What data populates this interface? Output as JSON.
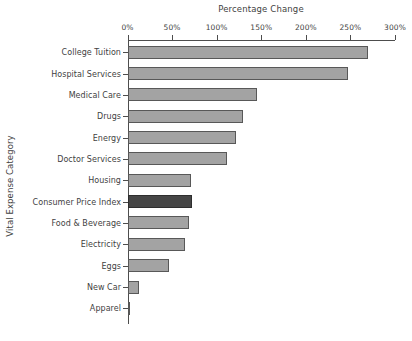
{
  "chart_data": {
    "type": "bar",
    "orientation": "horizontal",
    "title": "Percentage Change",
    "xlabel": "Percentage Change",
    "ylabel": "Vital Expense Category",
    "xlim": [
      0,
      300
    ],
    "xticks": [
      0,
      50,
      100,
      150,
      200,
      250,
      300
    ],
    "xticklabels": [
      "0%",
      "50%",
      "100%",
      "150%",
      "200%",
      "250%",
      "300%"
    ],
    "grid": false,
    "legend": "none",
    "axis_position": "top",
    "categories": [
      "College Tuition",
      "Hospital Services",
      "Medical Care",
      "Drugs",
      "Energy",
      "Doctor Services",
      "Housing",
      "Consumer Price Index",
      "Food & Beverage",
      "Electricity",
      "Eggs",
      "New Car",
      "Apparel"
    ],
    "values": [
      270,
      247,
      145,
      130,
      122,
      112,
      71,
      72,
      69,
      64,
      47,
      13,
      1
    ],
    "highlight_category": "Consumer Price Index",
    "colors": {
      "bar": "#a3a3a3",
      "bar_edge": "#585858",
      "highlight_bar": "#464646",
      "highlight_edge": "#2e2e2e",
      "axis": "#4d4d4d",
      "text": "#3f3f3f",
      "background": "#ffffff"
    }
  }
}
